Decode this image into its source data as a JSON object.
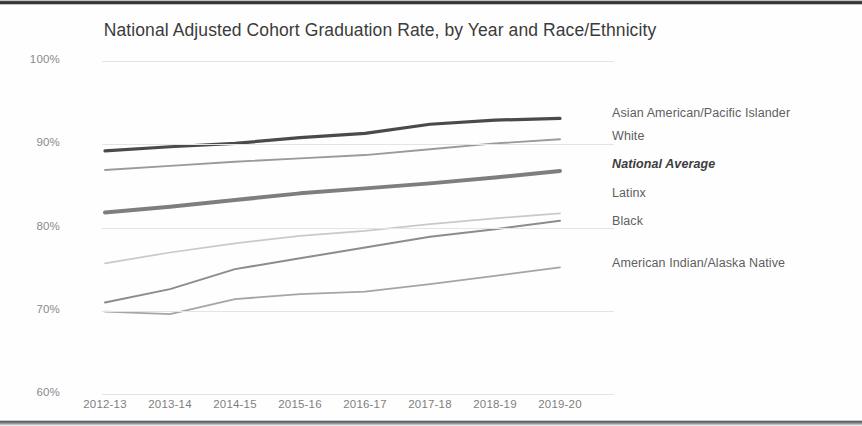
{
  "chart_data": {
    "type": "line",
    "title": "National Adjusted Cohort Graduation Rate, by Year and Race/Ethnicity",
    "xlabel": "",
    "ylabel": "",
    "ylim": [
      60,
      100
    ],
    "ytick_labels": [
      "100%",
      "90%",
      "80%",
      "70%",
      "60%"
    ],
    "ytick_values": [
      100,
      90,
      80,
      70,
      60
    ],
    "grid": true,
    "legend_position": "right-of-plot-at-line-end",
    "categories": [
      "2012-13",
      "2013-14",
      "2014-15",
      "2015-16",
      "2016-17",
      "2017-18",
      "2018-19",
      "2019-20"
    ],
    "series": [
      {
        "name": "Asian American/Pacific Islander",
        "color": "#4a4a4a",
        "width": 3.2,
        "emphasis": false,
        "values": [
          89.2,
          89.7,
          90.1,
          90.8,
          91.3,
          92.4,
          92.9,
          93.1
        ]
      },
      {
        "name": "White",
        "color": "#9a9a9a",
        "width": 1.9,
        "emphasis": false,
        "values": [
          86.9,
          87.4,
          87.9,
          88.3,
          88.7,
          89.4,
          90.1,
          90.6
        ]
      },
      {
        "name": "National Average",
        "color": "#7e7e7e",
        "width": 4.0,
        "emphasis": true,
        "values": [
          81.8,
          82.5,
          83.3,
          84.1,
          84.7,
          85.3,
          86.0,
          86.8
        ]
      },
      {
        "name": "Latinx",
        "color": "#c9c9c9",
        "width": 1.7,
        "emphasis": false,
        "values": [
          75.7,
          77.0,
          78.1,
          79.0,
          79.6,
          80.4,
          81.1,
          81.7
        ]
      },
      {
        "name": "Black",
        "color": "#8c8c8c",
        "width": 2.0,
        "emphasis": false,
        "values": [
          71.0,
          72.6,
          75.0,
          76.3,
          77.6,
          78.9,
          79.8,
          80.8
        ]
      },
      {
        "name": "American Indian/Alaska Native",
        "color": "#a5a5a5",
        "width": 1.8,
        "emphasis": false,
        "values": [
          69.9,
          69.6,
          71.4,
          72.0,
          72.3,
          73.2,
          74.2,
          75.2
        ]
      }
    ],
    "legend_label_y_px": [
      108,
      131,
      159,
      188,
      216,
      258
    ]
  }
}
